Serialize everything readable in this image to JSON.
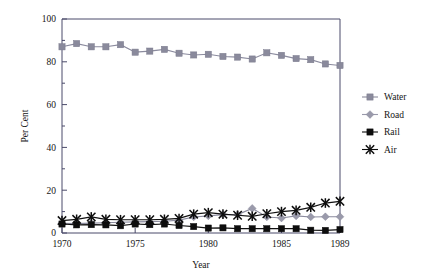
{
  "chart_data": {
    "type": "line",
    "xlabel": "Year",
    "ylabel": "Per Cent",
    "xlim": [
      1970,
      1989
    ],
    "ylim": [
      0,
      100
    ],
    "xticks": [
      "1970",
      "1975",
      "1980",
      "1985",
      "1989"
    ],
    "xtick_values": [
      1970,
      1975,
      1980,
      1985,
      1989
    ],
    "yticks": [
      "0",
      "20",
      "40",
      "60",
      "80",
      "100"
    ],
    "ytick_values": [
      0,
      20,
      40,
      60,
      80,
      100
    ],
    "grid": false,
    "legend_position": "right",
    "x": [
      1970,
      1971,
      1972,
      1973,
      1974,
      1975,
      1976,
      1977,
      1978,
      1979,
      1980,
      1981,
      1982,
      1983,
      1984,
      1985,
      1986,
      1987,
      1988,
      1989
    ],
    "series": [
      {
        "name": "Water",
        "marker": "square",
        "color": "#8a8a9c",
        "values": [
          87.0,
          88.5,
          87.0,
          87.0,
          88.0,
          84.5,
          85.0,
          85.8,
          84.0,
          83.2,
          83.5,
          82.5,
          82.2,
          81.3,
          84.2,
          83.0,
          81.5,
          81.0,
          79.0,
          78.3
        ]
      },
      {
        "name": "Road",
        "marker": "diamond",
        "color": "#9a9aab",
        "values": [
          4.5,
          4.4,
          4.6,
          4.8,
          5.0,
          5.2,
          5.3,
          5.5,
          6.0,
          7.5,
          8.0,
          8.6,
          8.6,
          11.5,
          7.5,
          7.0,
          8.0,
          7.5,
          7.6,
          7.6
        ]
      },
      {
        "name": "Rail",
        "marker": "square",
        "color": "#0d0d0d",
        "values": [
          4.2,
          3.8,
          3.9,
          3.8,
          3.4,
          4.2,
          3.9,
          4.2,
          3.5,
          3.0,
          2.3,
          2.4,
          2.0,
          2.0,
          2.0,
          2.0,
          2.0,
          1.3,
          1.2,
          1.6
        ]
      },
      {
        "name": "Air",
        "marker": "star",
        "color": "#0d0d0d",
        "values": [
          5.8,
          6.4,
          7.5,
          6.4,
          6.2,
          6.2,
          6.2,
          6.4,
          6.8,
          8.8,
          9.5,
          8.8,
          8.3,
          7.8,
          9.0,
          10.0,
          10.6,
          12.0,
          14.0,
          14.8
        ]
      }
    ]
  },
  "axes": {
    "ylabel": "Per Cent",
    "xlabel": "Year"
  },
  "legend": {
    "items": [
      {
        "label": "Water",
        "marker": "square",
        "color": "#8a8a9c"
      },
      {
        "label": "Road",
        "marker": "diamond",
        "color": "#9a9aab"
      },
      {
        "label": "Rail",
        "marker": "square",
        "color": "#0d0d0d"
      },
      {
        "label": "Air",
        "marker": "star",
        "color": "#0d0d0d"
      }
    ]
  }
}
